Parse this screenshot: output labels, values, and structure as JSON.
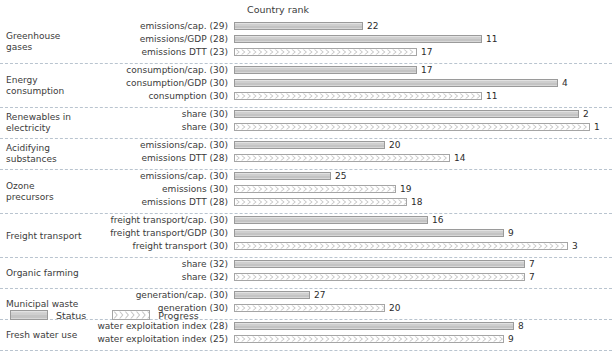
{
  "chart_title": "Country rank",
  "legend": {
    "position": "bottom-left",
    "entries": [
      {
        "key": "status",
        "label": "Status",
        "swatch": "solid-grey-bar"
      },
      {
        "key": "progress",
        "label": "Progress",
        "swatch": "chevron-hatched-bar"
      }
    ]
  },
  "axis": {
    "total_countries": 33,
    "note": "bar length is inverse to rank: rank 1 = longest bar"
  },
  "colors": {
    "status_fill": "#cfcfcf",
    "progress_fill": "#ffffff",
    "bar_border": "#9a9a9a",
    "separator": "#b9c4cf",
    "text": "#3b3b3b"
  },
  "chart_data": {
    "type": "bar",
    "title": "Country rank",
    "xlabel": "",
    "ylabel": "",
    "orientation": "horizontal",
    "xlim": [
      0,
      33
    ],
    "grid": false,
    "legend_position": "bottom-left",
    "series": [
      {
        "name": "Status",
        "key": "status"
      },
      {
        "name": "Progress",
        "key": "progress"
      }
    ],
    "groups": [
      {
        "group": "Greenhouse gases",
        "group_lines": [
          "Greenhouse",
          "gases"
        ],
        "rows": [
          {
            "label": "emissions/cap. (29)",
            "indicator": "emissions/cap.",
            "n": 29,
            "series": "status",
            "rank": 22
          },
          {
            "label": "emissions/GDP (28)",
            "indicator": "emissions/GDP",
            "n": 28,
            "series": "status",
            "rank": 11
          },
          {
            "label": "emissions DTT (23)",
            "indicator": "emissions DTT",
            "n": 23,
            "series": "progress",
            "rank": 17
          }
        ]
      },
      {
        "group": "Energy consumption",
        "group_lines": [
          "Energy",
          "consumption"
        ],
        "rows": [
          {
            "label": "consumption/cap. (30)",
            "indicator": "consumption/cap.",
            "n": 30,
            "series": "status",
            "rank": 17
          },
          {
            "label": "consumption/GDP (30)",
            "indicator": "consumption/GDP",
            "n": 30,
            "series": "status",
            "rank": 4
          },
          {
            "label": "consumption (30)",
            "indicator": "consumption",
            "n": 30,
            "series": "progress",
            "rank": 11
          }
        ]
      },
      {
        "group": "Renewables in electricity",
        "group_lines": [
          "Renewables in",
          "electricity"
        ],
        "rows": [
          {
            "label": "share (30)",
            "indicator": "share",
            "n": 30,
            "series": "status",
            "rank": 2
          },
          {
            "label": "share (30)",
            "indicator": "share",
            "n": 30,
            "series": "progress",
            "rank": 1
          }
        ]
      },
      {
        "group": "Acidifying substances",
        "group_lines": [
          "Acidifying",
          "substances"
        ],
        "rows": [
          {
            "label": "emissions/cap. (30)",
            "indicator": "emissions/cap.",
            "n": 30,
            "series": "status",
            "rank": 20
          },
          {
            "label": "emissions DTT (28)",
            "indicator": "emissions DTT",
            "n": 28,
            "series": "progress",
            "rank": 14
          }
        ]
      },
      {
        "group": "Ozone precursors",
        "group_lines": [
          "Ozone",
          "precursors"
        ],
        "rows": [
          {
            "label": "emissions/cap. (30)",
            "indicator": "emissions/cap.",
            "n": 30,
            "series": "status",
            "rank": 25
          },
          {
            "label": "emissions (30)",
            "indicator": "emissions",
            "n": 30,
            "series": "progress",
            "rank": 19
          },
          {
            "label": "emissions DTT (28)",
            "indicator": "emissions DTT",
            "n": 28,
            "series": "progress",
            "rank": 18
          }
        ]
      },
      {
        "group": "Freight transport",
        "group_lines": [
          "Freight transport"
        ],
        "rows": [
          {
            "label": "freight transport/cap. (30)",
            "indicator": "freight transport/cap.",
            "n": 30,
            "series": "status",
            "rank": 16
          },
          {
            "label": "freight transport/GDP (30)",
            "indicator": "freight transport/GDP",
            "n": 30,
            "series": "status",
            "rank": 9
          },
          {
            "label": "freight transport (30)",
            "indicator": "freight transport",
            "n": 30,
            "series": "progress",
            "rank": 3
          }
        ]
      },
      {
        "group": "Organic farming",
        "group_lines": [
          "Organic farming"
        ],
        "rows": [
          {
            "label": "share (32)",
            "indicator": "share",
            "n": 32,
            "series": "status",
            "rank": 7
          },
          {
            "label": "share (32)",
            "indicator": "share",
            "n": 32,
            "series": "progress",
            "rank": 7
          }
        ]
      },
      {
        "group": "Municipal waste",
        "group_lines": [
          "Municipal waste"
        ],
        "rows": [
          {
            "label": "generation/cap. (30)",
            "indicator": "generation/cap.",
            "n": 30,
            "series": "status",
            "rank": 27
          },
          {
            "label": "generation (30)",
            "indicator": "generation",
            "n": 30,
            "series": "progress",
            "rank": 20
          }
        ]
      },
      {
        "group": "Fresh water use",
        "group_lines": [
          "Fresh water use"
        ],
        "rows": [
          {
            "label": "water exploitation index (28)",
            "indicator": "water exploitation index",
            "n": 28,
            "series": "status",
            "rank": 8
          },
          {
            "label": "water exploitation index (25)",
            "indicator": "water exploitation index",
            "n": 25,
            "series": "progress",
            "rank": 9
          }
        ]
      }
    ]
  }
}
